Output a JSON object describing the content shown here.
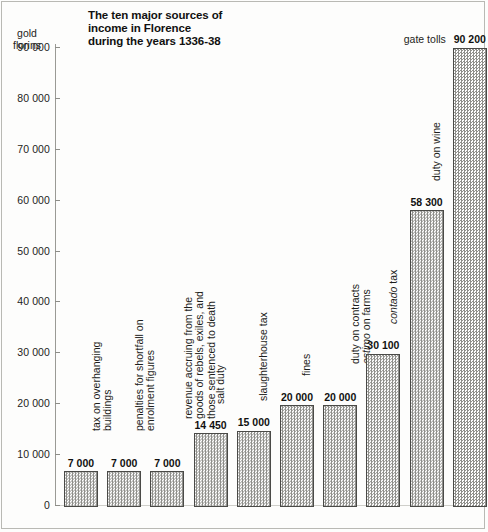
{
  "chart_data": {
    "type": "bar",
    "title_lines": [
      "The ten major sources of",
      "income in Florence",
      "during the years 1336-38"
    ],
    "ylabel": "gold florins",
    "ylabel_lines": [
      "gold",
      "florins"
    ],
    "xlabel": "",
    "ylim": [
      0,
      90000
    ],
    "ytick_labels": [
      "90 000",
      "80 000",
      "70 000",
      "60 000",
      "50 000",
      "40 000",
      "30 000",
      "20 000",
      "10 000",
      "0"
    ],
    "ytick_values": [
      90000,
      80000,
      70000,
      60000,
      50000,
      40000,
      30000,
      20000,
      10000,
      0
    ],
    "grid": false,
    "legend": "none",
    "categories": [
      "tax on overhanging buildings",
      "penalties for shortfall on enrolment figures",
      "revenue accruing from the goods of rebels, exiles, and those sentenced to death",
      "salt duty",
      "slaughterhouse tax",
      "fines",
      "duty on contracts estimo on farms",
      "contado tax",
      "duty on wine",
      "gate tolls"
    ],
    "values": [
      7000,
      7000,
      7000,
      14450,
      15000,
      20000,
      20000,
      30100,
      58300,
      90200
    ],
    "value_labels": [
      "7 000",
      "7 000",
      "7 000",
      "14 450",
      "15 000",
      "20 000",
      "20 000",
      "30 100",
      "58 300",
      "90 200"
    ],
    "bars": [
      {
        "label_lines": [
          "tax on overhanging",
          "buildings"
        ],
        "value_label": "7 000",
        "value": 7000,
        "orientation": "vertical"
      },
      {
        "label_lines": [
          "penalties for shortfall on",
          "enrolment figures"
        ],
        "value_label": "7 000",
        "value": 7000,
        "orientation": "vertical"
      },
      {
        "label_lines": [
          "revenue accruing from the",
          "goods of rebels, exiles, and",
          "those sentenced to death"
        ],
        "value_label": "7 000",
        "value": 7000,
        "orientation": "vertical"
      },
      {
        "label_lines": [
          "salt duty"
        ],
        "value_label": "14 450",
        "value": 14450,
        "orientation": "vertical"
      },
      {
        "label_lines": [
          "slaughterhouse tax"
        ],
        "value_label": "15 000",
        "value": 15000,
        "orientation": "vertical"
      },
      {
        "label_lines": [
          "fines"
        ],
        "value_label": "20 000",
        "value": 20000,
        "orientation": "vertical"
      },
      {
        "label_lines": [
          "duty on contracts",
          "estimo on farms"
        ],
        "label_italic_words": [
          "estimo"
        ],
        "value_label": "20 000",
        "value": 20000,
        "orientation": "vertical"
      },
      {
        "label_lines": [
          "contado tax"
        ],
        "label_italic_words": [
          "contado"
        ],
        "value_label": "30 100",
        "value": 30100,
        "orientation": "vertical"
      },
      {
        "label_lines": [
          "duty on wine"
        ],
        "value_label": "58 300",
        "value": 58300,
        "orientation": "vertical"
      },
      {
        "label_lines": [
          "gate tolls"
        ],
        "value_label": "90 200",
        "value": 90200,
        "orientation": "horizontal"
      }
    ]
  },
  "colors": {
    "bar_fill": "#e9e9e6",
    "bar_pattern": "#8f8f8b",
    "bar_border": "#4a4a47",
    "axis": "#9a9a95",
    "text": "#1d1d1b",
    "background": "#fdfdfc",
    "frame": "#b9b9b4"
  }
}
